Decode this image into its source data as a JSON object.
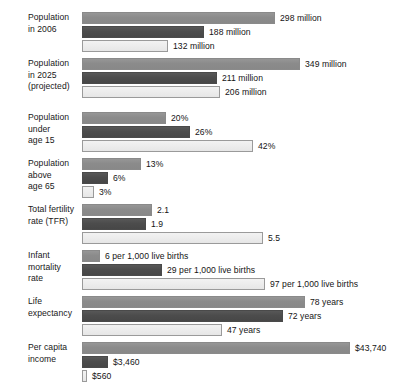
{
  "chart_data": {
    "type": "bar",
    "orientation": "horizontal",
    "title": "",
    "subtitle": "",
    "xlabel": "",
    "ylabel": "",
    "grid": false,
    "legend_position": "none",
    "series_colors": [
      "#8d8d8d",
      "#4e4e4e",
      "#eeeeee"
    ],
    "categories": [
      "Population\nin 2006",
      "Population\nin 2025\n(projected)",
      "Population\nunder\nage 15",
      "Population\nabove\nage 65",
      "Total fertility\nrate (TFR)",
      "Infant\nmortality\nrate",
      "Life\nexpectancy",
      "Per capita\nincome"
    ],
    "series": [
      {
        "name": "series-1",
        "values": [
          298,
          349,
          20,
          13,
          2.1,
          6,
          78,
          43740
        ],
        "labels": [
          "298 million",
          "349 million",
          "20%",
          "13%",
          "2.1",
          "6 per 1,000 live births",
          "78 years",
          "$43,740"
        ]
      },
      {
        "name": "series-2",
        "values": [
          188,
          211,
          26,
          6,
          1.9,
          29,
          72,
          3460
        ],
        "labels": [
          "188 million",
          "211 million",
          "26%",
          "6%",
          "1.9",
          "29 per 1,000 live births",
          "72 years",
          "$3,460"
        ]
      },
      {
        "name": "series-3",
        "values": [
          132,
          206,
          42,
          3,
          5.5,
          97,
          47,
          560
        ],
        "labels": [
          "132 million",
          "206 million",
          "42%",
          "3%",
          "5.5",
          "97 per 1,000 live births",
          "47 years",
          "$560"
        ]
      }
    ],
    "groups": [
      {
        "label": "Population\nin 2006",
        "top": 12,
        "bars": [
          {
            "series": 0,
            "value": 298,
            "label": "298 million",
            "width": 193
          },
          {
            "series": 1,
            "value": 188,
            "label": "188 million",
            "width": 122
          },
          {
            "series": 2,
            "value": 132,
            "label": "132 million",
            "width": 86
          }
        ]
      },
      {
        "label": "Population\nin 2025\n(projected)",
        "top": 58,
        "bars": [
          {
            "series": 0,
            "value": 349,
            "label": "349 million",
            "width": 218
          },
          {
            "series": 1,
            "value": 211,
            "label": "211 million",
            "width": 135
          },
          {
            "series": 2,
            "value": 206,
            "label": "206 million",
            "width": 138
          }
        ]
      },
      {
        "label": "Population\nunder\nage 15",
        "top": 112,
        "bars": [
          {
            "series": 0,
            "value": 20,
            "label": "20%",
            "width": 84
          },
          {
            "series": 1,
            "value": 26,
            "label": "26%",
            "width": 108
          },
          {
            "series": 2,
            "value": 42,
            "label": "42%",
            "width": 171
          }
        ]
      },
      {
        "label": "Population\nabove\nage 65",
        "top": 158,
        "bars": [
          {
            "series": 0,
            "value": 13,
            "label": "13%",
            "width": 59
          },
          {
            "series": 1,
            "value": 6,
            "label": "6%",
            "width": 26
          },
          {
            "series": 2,
            "value": 3,
            "label": "3%",
            "width": 12
          }
        ]
      },
      {
        "label": "Total fertility\nrate (TFR)",
        "top": 204,
        "bars": [
          {
            "series": 0,
            "value": 2.1,
            "label": "2.1",
            "width": 70
          },
          {
            "series": 1,
            "value": 1.9,
            "label": "1.9",
            "width": 64
          },
          {
            "series": 2,
            "value": 5.5,
            "label": "5.5",
            "width": 181
          }
        ]
      },
      {
        "label": "Infant\nmortality\nrate",
        "top": 250,
        "bars": [
          {
            "series": 0,
            "value": 6,
            "label": "6 per 1,000 live births",
            "width": 18
          },
          {
            "series": 1,
            "value": 29,
            "label": "29 per 1,000 live births",
            "width": 80
          },
          {
            "series": 2,
            "value": 97,
            "label": "97 per 1,000 live births",
            "width": 183
          }
        ]
      },
      {
        "label": "Life\nexpectancy",
        "top": 296,
        "bars": [
          {
            "series": 0,
            "value": 78,
            "label": "78 years",
            "width": 223
          },
          {
            "series": 1,
            "value": 72,
            "label": "72 years",
            "width": 201
          },
          {
            "series": 2,
            "value": 47,
            "label": "47 years",
            "width": 140
          }
        ]
      },
      {
        "label": "Per capita\nincome",
        "top": 342,
        "bars": [
          {
            "series": 0,
            "value": 43740,
            "label": "$43,740",
            "width": 268
          },
          {
            "series": 1,
            "value": 3460,
            "label": "$3,460",
            "width": 26
          },
          {
            "series": 2,
            "value": 560,
            "label": "$560",
            "width": 5
          }
        ]
      }
    ]
  }
}
